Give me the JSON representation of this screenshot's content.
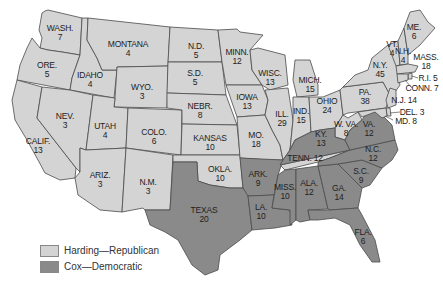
{
  "map": {
    "title": "1920 Presidential Election Electoral Votes",
    "colors": {
      "republican": "#d4d4d4",
      "democratic": "#8a8a8a",
      "border": "#4a4a4a"
    },
    "legend": [
      {
        "label": "Harding—Republican",
        "color": "#d4d4d4"
      },
      {
        "label": "Cox—Democratic",
        "color": "#8a8a8a"
      }
    ],
    "states": [
      {
        "abbr": "WASH.",
        "votes": "7",
        "party": "republican"
      },
      {
        "abbr": "ORE.",
        "votes": "5",
        "party": "republican"
      },
      {
        "abbr": "CALIF.",
        "votes": "13",
        "party": "republican"
      },
      {
        "abbr": "IDAHO",
        "votes": "4",
        "party": "republican"
      },
      {
        "abbr": "NEV.",
        "votes": "3",
        "party": "republican"
      },
      {
        "abbr": "MONTANA",
        "votes": "4",
        "party": "republican"
      },
      {
        "abbr": "WYO.",
        "votes": "3",
        "party": "republican"
      },
      {
        "abbr": "UTAH",
        "votes": "4",
        "party": "republican"
      },
      {
        "abbr": "ARIZ.",
        "votes": "3",
        "party": "republican"
      },
      {
        "abbr": "COLO.",
        "votes": "6",
        "party": "republican"
      },
      {
        "abbr": "N.M.",
        "votes": "3",
        "party": "republican"
      },
      {
        "abbr": "N.D.",
        "votes": "5",
        "party": "republican"
      },
      {
        "abbr": "S.D.",
        "votes": "5",
        "party": "republican"
      },
      {
        "abbr": "NEBR.",
        "votes": "8",
        "party": "republican"
      },
      {
        "abbr": "KANSAS",
        "votes": "10",
        "party": "republican"
      },
      {
        "abbr": "OKLA.",
        "votes": "10",
        "party": "republican"
      },
      {
        "abbr": "TEXAS",
        "votes": "20",
        "party": "democratic"
      },
      {
        "abbr": "MINN.",
        "votes": "12",
        "party": "republican"
      },
      {
        "abbr": "IOWA",
        "votes": "13",
        "party": "republican"
      },
      {
        "abbr": "MO.",
        "votes": "18",
        "party": "republican"
      },
      {
        "abbr": "ARK.",
        "votes": "9",
        "party": "democratic"
      },
      {
        "abbr": "LA.",
        "votes": "10",
        "party": "democratic"
      },
      {
        "abbr": "WISC.",
        "votes": "13",
        "party": "republican"
      },
      {
        "abbr": "ILL.",
        "votes": "29",
        "party": "republican"
      },
      {
        "abbr": "MICH.",
        "votes": "15",
        "party": "republican"
      },
      {
        "abbr": "IND.",
        "votes": "15",
        "party": "republican"
      },
      {
        "abbr": "OHIO",
        "votes": "24",
        "party": "republican"
      },
      {
        "abbr": "KY.",
        "votes": "13",
        "party": "democratic"
      },
      {
        "abbr": "TENN.",
        "votes": "12",
        "party": "republican"
      },
      {
        "abbr": "MISS.",
        "votes": "10",
        "party": "democratic"
      },
      {
        "abbr": "ALA.",
        "votes": "12",
        "party": "democratic"
      },
      {
        "abbr": "GA.",
        "votes": "14",
        "party": "democratic"
      },
      {
        "abbr": "FLA.",
        "votes": "6",
        "party": "democratic"
      },
      {
        "abbr": "S.C.",
        "votes": "9",
        "party": "democratic"
      },
      {
        "abbr": "N.C.",
        "votes": "12",
        "party": "democratic"
      },
      {
        "abbr": "VA.",
        "votes": "12",
        "party": "democratic"
      },
      {
        "abbr": "W. VA.",
        "votes": "8",
        "party": "republican"
      },
      {
        "abbr": "PA.",
        "votes": "38",
        "party": "republican"
      },
      {
        "abbr": "N.Y.",
        "votes": "45",
        "party": "republican"
      },
      {
        "abbr": "VT.",
        "votes": "4",
        "party": "republican"
      },
      {
        "abbr": "N.H.",
        "votes": "4",
        "party": "republican"
      },
      {
        "abbr": "ME.",
        "votes": "6",
        "party": "republican"
      },
      {
        "abbr": "MASS.",
        "votes": "18",
        "party": "republican"
      },
      {
        "abbr": "R.I.",
        "votes": "5",
        "party": "republican"
      },
      {
        "abbr": "CONN.",
        "votes": "7",
        "party": "republican"
      },
      {
        "abbr": "N.J.",
        "votes": "14",
        "party": "republican"
      },
      {
        "abbr": "DEL.",
        "votes": "3",
        "party": "republican"
      },
      {
        "abbr": "MD.",
        "votes": "8",
        "party": "republican"
      }
    ]
  }
}
